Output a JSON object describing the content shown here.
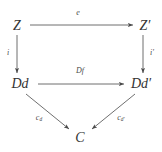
{
  "diagram": {
    "type": "commutative-diagram",
    "background_color": "#ffffff",
    "ink_color": "#333333",
    "nodes": [
      {
        "id": "Z",
        "label": "Z",
        "x": 17,
        "y": 26
      },
      {
        "id": "Zp",
        "label": "Z′",
        "x": 145,
        "y": 26
      },
      {
        "id": "Dd",
        "label": "Dd",
        "x": 20,
        "y": 84
      },
      {
        "id": "Ddp",
        "label": "Dd′",
        "x": 141,
        "y": 84
      },
      {
        "id": "C",
        "label": "C",
        "x": 80,
        "y": 138
      }
    ],
    "edges": [
      {
        "id": "e",
        "label": "e",
        "from": "Z",
        "to": "Zp",
        "label_x": 78,
        "label_y": 13
      },
      {
        "id": "i",
        "label": "i",
        "from": "Z",
        "to": "Dd",
        "label_x": 8,
        "label_y": 53
      },
      {
        "id": "ip",
        "label": "i′",
        "from": "Zp",
        "to": "Ddp",
        "label_x": 152,
        "label_y": 53
      },
      {
        "id": "Df",
        "label": "Df",
        "from": "Dd",
        "to": "Ddp",
        "label_x": 80,
        "label_y": 71
      },
      {
        "id": "cd",
        "label": "c",
        "sub": "d",
        "from": "Dd",
        "to": "C",
        "label_x": 39,
        "label_y": 118
      },
      {
        "id": "cdp",
        "label": "c",
        "sub": "d′",
        "from": "Ddp",
        "to": "C",
        "label_x": 121,
        "label_y": 118
      }
    ]
  }
}
